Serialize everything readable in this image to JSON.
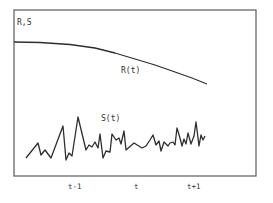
{
  "chart_data": {
    "type": "line",
    "title": "",
    "ylabel": "R,S",
    "xlabel": "",
    "x_tick_labels": [
      "t-1",
      "t",
      "t+1"
    ],
    "grid": false,
    "legend": "inline labels",
    "frame_px": {
      "left": 14,
      "top": 10,
      "right": 256,
      "bottom": 176
    },
    "x_tick_px": [
      74,
      136,
      194
    ],
    "series": [
      {
        "name": "R(t)",
        "label": "R(t)",
        "label_px": [
          122,
          72
        ],
        "description": "smooth decreasing curve",
        "points_px": [
          [
            14,
            42
          ],
          [
            40,
            42.5
          ],
          [
            70,
            44.5
          ],
          [
            95,
            48
          ],
          [
            115,
            53
          ],
          [
            135,
            59
          ],
          [
            155,
            65
          ],
          [
            175,
            72
          ],
          [
            192,
            78
          ],
          [
            207,
            84
          ]
        ]
      },
      {
        "name": "S(t)",
        "label": "S(t)",
        "label_px": [
          101,
          120
        ],
        "description": "noisy fluctuating series",
        "points_px": [
          [
            26,
            158
          ],
          [
            38,
            143
          ],
          [
            41,
            155
          ],
          [
            45,
            150
          ],
          [
            51,
            158
          ],
          [
            63,
            126
          ],
          [
            66,
            160
          ],
          [
            69,
            153
          ],
          [
            72,
            156
          ],
          [
            78,
            117
          ],
          [
            86,
            150
          ],
          [
            89,
            145
          ],
          [
            92,
            147
          ],
          [
            95,
            142
          ],
          [
            98,
            148
          ],
          [
            100,
            134
          ],
          [
            103,
            158
          ],
          [
            106,
            151
          ],
          [
            110,
            152
          ],
          [
            112,
            134
          ],
          [
            116,
            140
          ],
          [
            119,
            138
          ],
          [
            121,
            144
          ],
          [
            124,
            131
          ],
          [
            126,
            150
          ],
          [
            134,
            143
          ],
          [
            142,
            148
          ],
          [
            146,
            146
          ],
          [
            150,
            140
          ],
          [
            153,
            135
          ],
          [
            156,
            145
          ],
          [
            159,
            141
          ],
          [
            161,
            151
          ],
          [
            164,
            142
          ],
          [
            168,
            146
          ],
          [
            170,
            143
          ],
          [
            173,
            142
          ],
          [
            175,
            145
          ],
          [
            177,
            128
          ],
          [
            180,
            138
          ],
          [
            182,
            146
          ],
          [
            184,
            139
          ],
          [
            186,
            144
          ],
          [
            188,
            133
          ],
          [
            191,
            144
          ],
          [
            194,
            136
          ],
          [
            196,
            122
          ],
          [
            199,
            146
          ],
          [
            201,
            135
          ],
          [
            203,
            140
          ],
          [
            205,
            136
          ]
        ]
      }
    ]
  },
  "labels": {
    "y_axis": "R,S",
    "r_series": "R(t)",
    "s_series": "S(t)",
    "tick_tm1": "t-1",
    "tick_t": "t",
    "tick_tp1": "t+1"
  }
}
